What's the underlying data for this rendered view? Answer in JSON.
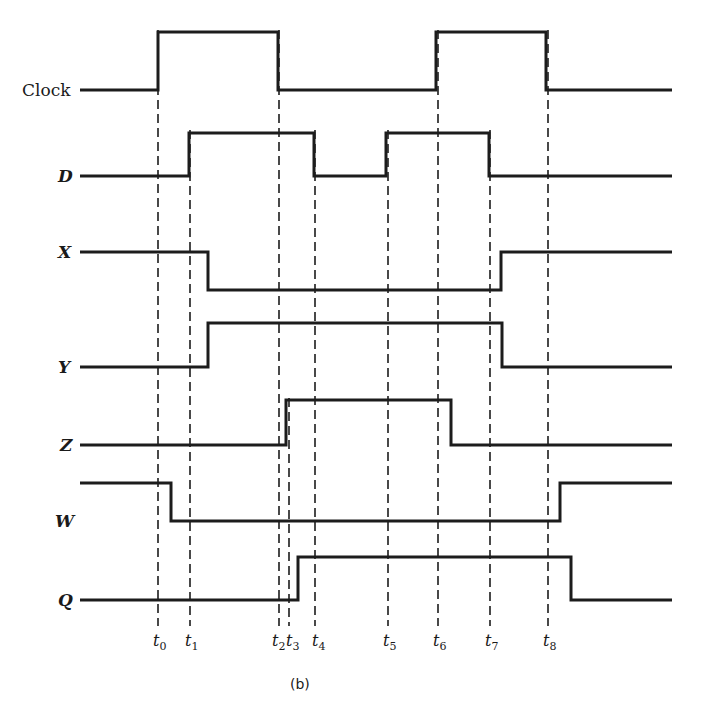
{
  "diagram": {
    "type": "timing-diagram",
    "caption": "(b)",
    "signals": [
      {
        "name": "Clock",
        "italic": false,
        "initial": 0,
        "transitions": [
          "t0",
          "t2",
          "t6",
          "t8"
        ]
      },
      {
        "name": "D",
        "italic": true,
        "initial": 0,
        "transitions": [
          "t1",
          "t4",
          "t5",
          "t7"
        ]
      },
      {
        "name": "X",
        "italic": true,
        "initial": 1,
        "transitions": [
          "after t1",
          "after t7"
        ]
      },
      {
        "name": "Y",
        "italic": true,
        "initial": 0,
        "transitions": [
          "after t1",
          "after t7"
        ]
      },
      {
        "name": "Z",
        "italic": true,
        "initial": 0,
        "transitions": [
          "t3",
          "after t6"
        ]
      },
      {
        "name": "W",
        "italic": true,
        "initial": 1,
        "transitions": [
          "after t0",
          "after t8"
        ]
      },
      {
        "name": "Q",
        "italic": true,
        "initial": 0,
        "transitions": [
          "after t3",
          "after t8"
        ]
      }
    ],
    "time_markers": [
      {
        "base": "t",
        "sub": "0"
      },
      {
        "base": "t",
        "sub": "1"
      },
      {
        "base": "t",
        "sub": "2"
      },
      {
        "base": "t",
        "sub": "3"
      },
      {
        "base": "t",
        "sub": "4"
      },
      {
        "base": "t",
        "sub": "5"
      },
      {
        "base": "t",
        "sub": "6"
      },
      {
        "base": "t",
        "sub": "7"
      },
      {
        "base": "t",
        "sub": "8"
      }
    ]
  }
}
